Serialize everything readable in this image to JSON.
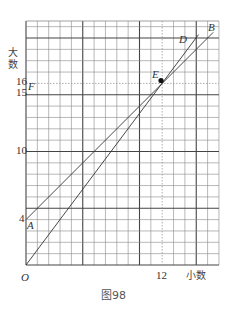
{
  "figure": {
    "caption": "图98",
    "y_axis_label_line1": "大",
    "y_axis_label_line2": "数",
    "x_axis_label": "小数",
    "origin_label": "O",
    "y_ticks": [
      {
        "value": 4,
        "label": "4"
      },
      {
        "value": 10,
        "label": "10"
      },
      {
        "value": 15,
        "label": "15"
      },
      {
        "value": 16,
        "label": "16"
      }
    ],
    "x_ticks": [
      {
        "value": 12,
        "label": "12"
      }
    ],
    "points": {
      "A": {
        "label": "A",
        "x": 0,
        "y": 4
      },
      "B": {
        "label": "B",
        "x": 16.5,
        "y": 20.5
      },
      "D": {
        "label": "D",
        "x": 15.2,
        "y": 20.3
      },
      "E": {
        "label": "E",
        "x": 12,
        "y": 16
      },
      "F": {
        "label": "F",
        "x": 0,
        "y": 15
      },
      "O": {
        "label": "O",
        "x": 0,
        "y": 0
      }
    },
    "lines": [
      {
        "name": "AB",
        "from": "A",
        "to": "B",
        "equation": "y = x + 4"
      },
      {
        "name": "OD",
        "from": "O",
        "to": "D",
        "equation": "y = 4x/3"
      }
    ],
    "grid": {
      "columns": 17,
      "rows": 21.5,
      "major_every": 5
    },
    "colors": {
      "grid": "#888888",
      "grid_major": "#444444",
      "line": "#333333"
    }
  }
}
